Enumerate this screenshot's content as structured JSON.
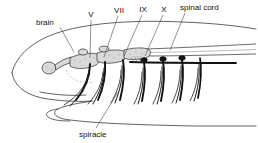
{
  "figure": {
    "background_color": "#ffffff",
    "ink_color": "#1a1a1a",
    "leader_color": "#4a4a4a",
    "ganglion_fill": "#d9d9d9"
  },
  "labels": {
    "brain": "brain",
    "nerve_v": "V",
    "nerve_vii": "VII",
    "nerve_ix": "IX",
    "nerve_x": "X",
    "spinal_cord": "spinal cord",
    "spiracle": "spiracle"
  },
  "label_positions": {
    "brain": {
      "x": 36,
      "y": 25,
      "anchor": "start"
    },
    "nerve_v": {
      "x": 91,
      "y": 17,
      "anchor": "middle"
    },
    "nerve_vii": {
      "x": 119,
      "y": 13,
      "anchor": "middle"
    },
    "nerve_ix": {
      "x": 143,
      "y": 12,
      "anchor": "middle"
    },
    "nerve_x": {
      "x": 164,
      "y": 12,
      "anchor": "middle"
    },
    "spinal_cord": {
      "x": 180,
      "y": 10,
      "anchor": "start"
    },
    "spiracle": {
      "x": 79,
      "y": 135,
      "anchor": "start"
    }
  },
  "leader_lines": [
    {
      "name": "brain-leader",
      "x1": 60,
      "y1": 27,
      "x2": 74,
      "y2": 52
    },
    {
      "name": "nerve-v-leader",
      "x1": 91,
      "y1": 20,
      "x2": 90,
      "y2": 58
    },
    {
      "name": "nerve-vii-leader",
      "x1": 118,
      "y1": 16,
      "x2": 104,
      "y2": 57
    },
    {
      "name": "nerve-ix-leader",
      "x1": 142,
      "y1": 15,
      "x2": 124,
      "y2": 56
    },
    {
      "name": "nerve-x-leader",
      "x1": 163,
      "y1": 15,
      "x2": 145,
      "y2": 56
    },
    {
      "name": "spinal-cord-leader",
      "x1": 185,
      "y1": 13,
      "x2": 170,
      "y2": 50
    },
    {
      "name": "spiracle-leader",
      "x1": 96,
      "y1": 128,
      "x2": 118,
      "y2": 92
    }
  ],
  "nerve_branches": [
    {
      "name": "nerve-branch-1",
      "root_x": 90
    },
    {
      "name": "nerve-branch-2",
      "root_x": 105
    },
    {
      "name": "nerve-branch-3",
      "root_x": 123
    },
    {
      "name": "nerve-branch-4",
      "root_x": 144
    },
    {
      "name": "nerve-branch-5",
      "root_x": 163
    },
    {
      "name": "nerve-branch-6",
      "root_x": 182
    },
    {
      "name": "nerve-branch-7",
      "root_x": 200
    }
  ]
}
